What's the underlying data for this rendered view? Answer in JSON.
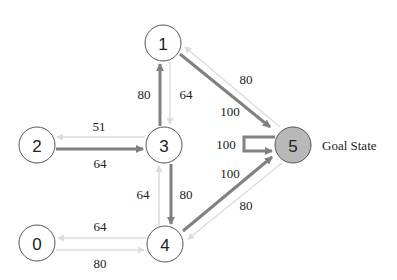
{
  "diagram": {
    "type": "state-transition-graph",
    "colors": {
      "node_fill": "#ffffff",
      "node_stroke": "#555555",
      "goal_fill": "#b8b8b8",
      "strong_edge": "#808080",
      "weak_edge": "#dcdcdc",
      "text": "#222222"
    },
    "nodes": [
      {
        "id": "0",
        "label": "0",
        "x": 37,
        "y": 243
      },
      {
        "id": "1",
        "label": "1",
        "x": 163,
        "y": 43
      },
      {
        "id": "2",
        "label": "2",
        "x": 37,
        "y": 145
      },
      {
        "id": "3",
        "label": "3",
        "x": 164,
        "y": 145
      },
      {
        "id": "4",
        "label": "4",
        "x": 165,
        "y": 244
      },
      {
        "id": "5",
        "label": "5",
        "x": 293,
        "y": 145,
        "goal": true
      }
    ],
    "goal_label": "Goal State",
    "edges": [
      {
        "from": "3",
        "to": "1",
        "weight": "80",
        "style": "strong"
      },
      {
        "from": "1",
        "to": "3",
        "weight": "64",
        "style": "weak"
      },
      {
        "from": "1",
        "to": "5",
        "weight": "100",
        "style": "strong"
      },
      {
        "from": "5",
        "to": "1",
        "weight": "80",
        "style": "weak"
      },
      {
        "from": "3",
        "to": "2",
        "weight": "51",
        "style": "weak"
      },
      {
        "from": "2",
        "to": "3",
        "weight": "64",
        "style": "strong"
      },
      {
        "from": "5",
        "to": "5",
        "weight": "100",
        "style": "strong"
      },
      {
        "from": "3",
        "to": "4",
        "weight": "80",
        "style": "strong"
      },
      {
        "from": "4",
        "to": "3",
        "weight": "64",
        "style": "weak"
      },
      {
        "from": "4",
        "to": "5",
        "weight": "100",
        "style": "strong"
      },
      {
        "from": "5",
        "to": "4",
        "weight": "80",
        "style": "weak"
      },
      {
        "from": "4",
        "to": "0",
        "weight": "64",
        "style": "weak"
      },
      {
        "from": "0",
        "to": "4",
        "weight": "80",
        "style": "weak"
      }
    ]
  }
}
